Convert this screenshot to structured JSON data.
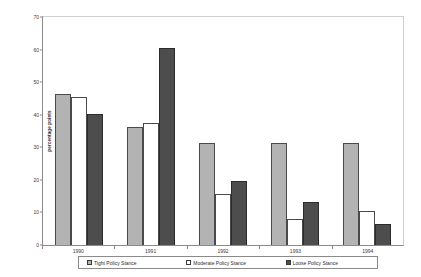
{
  "chart_data": {
    "type": "bar",
    "title": "",
    "subtitle": "",
    "xlabel": "",
    "ylabel": "percentage points",
    "ylim": [
      0,
      70
    ],
    "ytick_step": 10,
    "yticks": [
      "0",
      "10",
      "20",
      "30",
      "40",
      "50",
      "60",
      "70"
    ],
    "grid": false,
    "legend_position": "bottom",
    "categories": [
      "1990",
      "1991",
      "1992",
      "1993",
      "1994"
    ],
    "series": [
      {
        "name": "Tight Policy Stance",
        "color": "#b3b3b3",
        "values": [
          46,
          36,
          31,
          31,
          31
        ]
      },
      {
        "name": "Moderate Policy Stance",
        "color": "#ffffff",
        "values": [
          45,
          37,
          15.5,
          8,
          10.5
        ]
      },
      {
        "name": "Loose Policy Stance",
        "color": "#4d4d4d",
        "values": [
          40,
          60,
          19.5,
          13,
          6.5
        ]
      }
    ]
  }
}
